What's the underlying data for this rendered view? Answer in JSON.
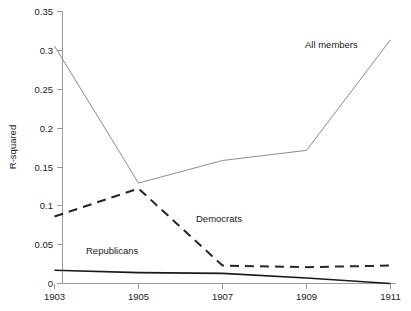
{
  "chart_data": {
    "type": "line",
    "title": "",
    "xlabel": "",
    "ylabel": "R-squared",
    "x": [
      1903,
      1905,
      1907,
      1909,
      1911
    ],
    "xtick_labels": [
      "1903",
      "1905",
      "1907",
      "1909",
      "1911"
    ],
    "xlim": [
      1903,
      1911
    ],
    "ylim": [
      0,
      0.35
    ],
    "ytick_labels": [
      "0",
      "0.05",
      "0.1",
      "0.15",
      "0.2",
      "0.25",
      "0.3",
      "0.35"
    ],
    "ytick_values": [
      0,
      0.05,
      0.1,
      0.15,
      0.2,
      0.25,
      0.3,
      0.35
    ],
    "grid": false,
    "legend_position": "inline-annotations",
    "series": [
      {
        "name": "All members",
        "values": [
          0.305,
          0.129,
          0.158,
          0.171,
          0.313
        ],
        "style": "solid",
        "color": "#8c8c8c",
        "label_x": 1909.2,
        "label_y": 0.313
      },
      {
        "name": "Democrats",
        "values": [
          0.086,
          0.122,
          0.023,
          0.021,
          0.023
        ],
        "style": "dashed",
        "color": "#262626",
        "label_x": 1906.4,
        "label_y": 0.079
      },
      {
        "name": "Republicans",
        "values": [
          0.017,
          0.014,
          0.013,
          0.007,
          0.0
        ],
        "style": "solid",
        "color": "#1a1a1a",
        "label_x": 1904.3,
        "label_y": 0.042
      }
    ]
  },
  "labels": {
    "all_members": "All members",
    "democrats": "Democrats",
    "republicans": "Republicans",
    "y_axis_title": "R-squared",
    "ytick_0": "0",
    "ytick_1": "0.05",
    "ytick_2": "0.1",
    "ytick_3": "0.15",
    "ytick_4": "0.2",
    "ytick_5": "0.25",
    "ytick_6": "0.3",
    "ytick_7": "0.35",
    "xtick_0": "1903",
    "xtick_1": "1905",
    "xtick_2": "1907",
    "xtick_3": "1909",
    "xtick_4": "1911"
  }
}
